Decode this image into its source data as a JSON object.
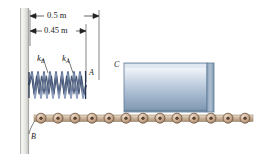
{
  "figure": {
    "dimensions": [
      {
        "id": "dim-top",
        "value": "0.5 m"
      },
      {
        "id": "dim-bottom",
        "value": "0.45 m"
      }
    ],
    "springs": [
      {
        "id": "spring-b",
        "symbol": "k",
        "subscript": "B"
      },
      {
        "id": "spring-a",
        "symbol": "k",
        "subscript": "A"
      }
    ],
    "points": [
      {
        "id": "point-a",
        "label": "A"
      },
      {
        "id": "point-b",
        "label": "B"
      },
      {
        "id": "point-c",
        "label": "C"
      }
    ],
    "components": {
      "wall": "fixed-wall",
      "block": "sliding-block-C",
      "track": "roller-track",
      "roller_count": 13
    },
    "colors": {
      "wall_light": "#f2f2f0",
      "wall_dark": "#c9c9c4",
      "spring_dark": "#1b2a4a",
      "spring_light": "#8fa2c4",
      "block_light": "#e9eff7",
      "block_mid": "#9fb4cc",
      "block_dark": "#6d86a3",
      "roller_fill": "#c9ab93",
      "roller_edge": "#6b5036",
      "track_fill": "#cbb49c",
      "line": "#222222"
    }
  }
}
